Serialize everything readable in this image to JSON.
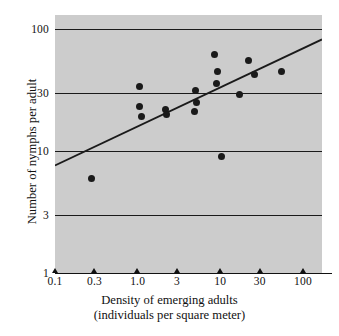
{
  "chart_data": {
    "type": "scatter",
    "title": "",
    "xlabel": "Density of emerging adults (individuals per square meter)",
    "xlabel_line1": "Density of emerging adults",
    "xlabel_line2": "(individuals per square meter)",
    "ylabel": "Number of nymphs per adult",
    "xscale": "log",
    "yscale": "log",
    "xlim": [
      0.1,
      170
    ],
    "ylim": [
      1,
      130
    ],
    "grid": "horizontal",
    "legend": "none",
    "xticks": [
      {
        "value": 0.1,
        "label": "0.1"
      },
      {
        "value": 0.3,
        "label": "0.3"
      },
      {
        "value": 1.0,
        "label": "1.0"
      },
      {
        "value": 3,
        "label": "3"
      },
      {
        "value": 10,
        "label": "10"
      },
      {
        "value": 30,
        "label": "30"
      },
      {
        "value": 100,
        "label": "100"
      }
    ],
    "yticks": [
      {
        "value": 1,
        "label": "1"
      },
      {
        "value": 3,
        "label": "3"
      },
      {
        "value": 10,
        "label": "10"
      },
      {
        "value": 30,
        "label": "30"
      },
      {
        "value": 100,
        "label": "100"
      }
    ],
    "gridlines_y": [
      3,
      10,
      30,
      100
    ],
    "points": [
      {
        "x": 0.28,
        "y": 6.0
      },
      {
        "x": 1.05,
        "y": 34.0
      },
      {
        "x": 1.05,
        "y": 23.0
      },
      {
        "x": 1.12,
        "y": 19.0
      },
      {
        "x": 2.2,
        "y": 22.0
      },
      {
        "x": 2.25,
        "y": 20.0
      },
      {
        "x": 5.0,
        "y": 31.0
      },
      {
        "x": 5.2,
        "y": 25.0
      },
      {
        "x": 4.9,
        "y": 21.0
      },
      {
        "x": 8.5,
        "y": 62.0
      },
      {
        "x": 9.2,
        "y": 45.0
      },
      {
        "x": 8.9,
        "y": 36.0
      },
      {
        "x": 10.2,
        "y": 9.0
      },
      {
        "x": 17.0,
        "y": 29.0
      },
      {
        "x": 22.0,
        "y": 55.0
      },
      {
        "x": 26.0,
        "y": 42.0
      },
      {
        "x": 55.0,
        "y": 45.0
      }
    ],
    "trendline": {
      "type": "linear-on-log-log",
      "x_start": 0.1,
      "y_start": 7.6,
      "x_end": 170,
      "y_end": 82.0
    },
    "colors": {
      "plot_background": "#cccccc",
      "point": "#1a1a1a",
      "line": "#1a1a1a",
      "gridline": "#1a1a1a",
      "text": "#111111",
      "page_background": "#ffffff"
    }
  }
}
